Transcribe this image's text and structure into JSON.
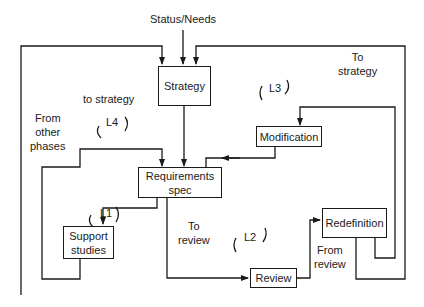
{
  "diagram": {
    "input_label": "Status/Needs",
    "boxes": {
      "strategy": "Strategy",
      "modification": "Modification",
      "requirements_line1": "Requirements",
      "requirements_line2": "spec",
      "support_line1": "Support",
      "support_line2": "studies",
      "review": "Review",
      "redefinition": "Redefinition"
    },
    "labels": {
      "to_strategy_left": "to strategy",
      "from_other_1": "From",
      "from_other_2": "other",
      "from_other_3": "phases",
      "to_strategy_right_1": "To",
      "to_strategy_right_2": "strategy",
      "to_review_1": "To",
      "to_review_2": "review",
      "from_review_1": "From",
      "from_review_2": "review"
    },
    "loops": {
      "l1": "L1",
      "l2": "L2",
      "l3": "L3",
      "l4": "L4"
    }
  }
}
